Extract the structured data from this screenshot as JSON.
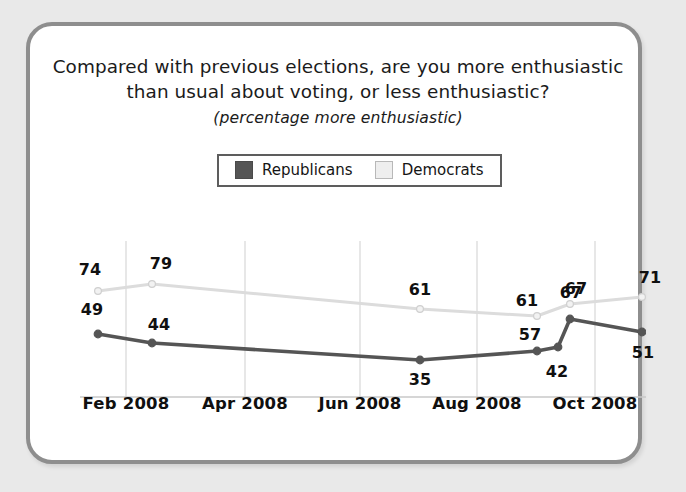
{
  "card": {
    "title_line_1": "Compared with previous elections, are you more enthusiastic",
    "title_line_2": "than usual about voting, or less enthusiastic?",
    "subtitle": "(percentage more enthusiastic)"
  },
  "legend": {
    "entries": [
      {
        "label": "Republicans",
        "color": "#555555",
        "swatch": "rep"
      },
      {
        "label": "Democrats",
        "color": "#dcdcdc",
        "swatch": "dem"
      }
    ]
  },
  "chart_data": {
    "type": "line",
    "title": "Compared with previous elections, are you more enthusiastic than usual about voting, or less enthusiastic?",
    "subtitle": "(percentage more enthusiastic)",
    "xlabel": "",
    "ylabel": "",
    "ylim": [
      0,
      100
    ],
    "grid": "vertical",
    "legend_position": "top-center",
    "tick_labels": [
      "Feb 2008",
      "Apr 2008",
      "Jun 2008",
      "Aug 2008",
      "Oct 2008"
    ],
    "tick_positions_px": [
      96,
      215,
      330,
      447,
      565
    ],
    "series": [
      {
        "name": "Republicans",
        "color": "#555555",
        "points": [
          {
            "label": "49",
            "value": 49,
            "x_px": 68,
            "y_px": 308,
            "label_x_px": 62,
            "label_y_px": 283
          },
          {
            "label": "44",
            "value": 44,
            "x_px": 122,
            "y_px": 317,
            "label_x_px": 129,
            "label_y_px": 298
          },
          {
            "label": "35",
            "value": 35,
            "x_px": 390,
            "y_px": 334,
            "label_x_px": 390,
            "label_y_px": 353
          },
          {
            "label": "57",
            "value": 57,
            "x_px": 507,
            "y_px": 325,
            "label_x_px": 500,
            "label_y_px": 308
          },
          {
            "label": "42",
            "value": 42,
            "x_px": 528,
            "y_px": 321,
            "label_x_px": 527,
            "label_y_px": 345
          },
          {
            "label": "67",
            "value": 67,
            "x_px": 540,
            "y_px": 293,
            "label_x_px": 541,
            "label_y_px": 266
          },
          {
            "label": "51",
            "value": 51,
            "x_px": 612,
            "y_px": 306,
            "label_x_px": 613,
            "label_y_px": 326
          }
        ]
      },
      {
        "name": "Democrats",
        "color": "#dcdcdc",
        "points": [
          {
            "label": "74",
            "value": 74,
            "x_px": 68,
            "y_px": 265,
            "label_x_px": 60,
            "label_y_px": 243
          },
          {
            "label": "79",
            "value": 79,
            "x_px": 122,
            "y_px": 258,
            "label_x_px": 131,
            "label_y_px": 237
          },
          {
            "label": "61",
            "value": 61,
            "x_px": 390,
            "y_px": 283,
            "label_x_px": 390,
            "label_y_px": 263
          },
          {
            "label": "61",
            "value": 61,
            "x_px": 507,
            "y_px": 290,
            "label_x_px": 497,
            "label_y_px": 274
          },
          {
            "label": "67",
            "value": 67,
            "x_px": 540,
            "y_px": 278,
            "label_x_px": 546,
            "label_y_px": 262
          },
          {
            "label": "71",
            "value": 71,
            "x_px": 612,
            "y_px": 271,
            "label_x_px": 620,
            "label_y_px": 251
          }
        ]
      }
    ],
    "gridlines_px": [
      96,
      215,
      330,
      447,
      565
    ],
    "baseline_y_px": 371,
    "plot_left_px": 50,
    "plot_right_px": 625
  }
}
